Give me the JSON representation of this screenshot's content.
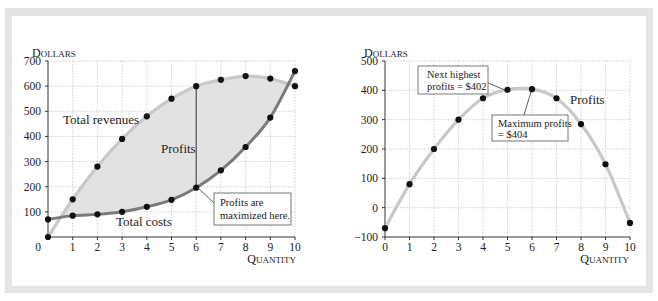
{
  "chart_data": [
    {
      "type": "line",
      "title": "",
      "ylabel": "Dollars",
      "xlabel": "Quantity",
      "xlim": [
        0,
        10
      ],
      "ylim": [
        0,
        700
      ],
      "x_ticks": [
        0,
        1,
        2,
        3,
        4,
        5,
        6,
        7,
        8,
        9,
        10
      ],
      "y_ticks": [
        100,
        200,
        300,
        400,
        500,
        600,
        700
      ],
      "y_tick_labels": [
        "100",
        "200",
        "300",
        "400",
        "500",
        "600",
        "700"
      ],
      "origin_label": "0",
      "grid": true,
      "x": [
        0,
        1,
        2,
        3,
        4,
        5,
        6,
        7,
        8,
        9,
        10
      ],
      "series": [
        {
          "name": "Total revenues",
          "values": [
            0,
            150,
            280,
            390,
            480,
            550,
            600,
            625,
            640,
            630,
            600
          ],
          "color": "#c8c8c8"
        },
        {
          "name": "Total costs",
          "values": [
            70,
            85,
            90,
            100,
            120,
            148,
            196,
            265,
            358,
            475,
            660
          ],
          "color": "#7a7a7a"
        }
      ],
      "shaded_region": {
        "label": "Profits",
        "between": [
          "Total revenues",
          "Total costs"
        ],
        "color": "#e2e2e2"
      },
      "annotations": [
        {
          "text_lines": [
            "Profits are",
            "maximized here."
          ],
          "points_to": {
            "x": 6,
            "y": 196
          },
          "boxed": true
        },
        {
          "text": "Total revenues"
        },
        {
          "text": "Total costs"
        },
        {
          "text": "Profits"
        }
      ],
      "marker_line": {
        "x": 6,
        "from": 196,
        "to": 600
      }
    },
    {
      "type": "line",
      "title": "",
      "ylabel": "Dollars",
      "xlabel": "Quantity",
      "xlim": [
        0,
        10
      ],
      "ylim": [
        -100,
        500
      ],
      "x_ticks": [
        0,
        1,
        2,
        3,
        4,
        5,
        6,
        7,
        8,
        9,
        10
      ],
      "y_ticks": [
        -100,
        0,
        100,
        200,
        300,
        400,
        500
      ],
      "y_tick_labels": [
        "−100",
        "0",
        "100",
        "200",
        "300",
        "400",
        "500"
      ],
      "grid": true,
      "x": [
        0,
        1,
        2,
        3,
        4,
        5,
        6,
        7,
        8,
        9,
        10
      ],
      "series": [
        {
          "name": "Profits",
          "values": [
            -70,
            80,
            200,
            300,
            373,
            402,
            404,
            373,
            285,
            148,
            -52
          ],
          "color": "#c8c8c8"
        }
      ],
      "annotations": [
        {
          "text_lines": [
            "Next highest",
            "profits = $402"
          ],
          "points_to": {
            "x": 5,
            "y": 402
          },
          "boxed": true
        },
        {
          "text_lines": [
            "Maximum profits",
            "= $404"
          ],
          "points_to": {
            "x": 6,
            "y": 404
          },
          "boxed": true
        },
        {
          "text": "Profits"
        }
      ]
    }
  ],
  "labels": {
    "dollars_caps": "D",
    "dollars_rest": "OLLARS",
    "quantity_caps": "Q",
    "quantity_rest": "UANTITY"
  }
}
